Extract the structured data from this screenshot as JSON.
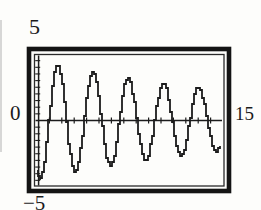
{
  "figure": {
    "kind": "graphing-calculator viewing window (scanned textbook figure)",
    "labels": {
      "ymax": "5",
      "origin": "0",
      "xmax": "15",
      "ymin": "−5"
    },
    "ink_color": "#1c1c1c",
    "frame_color": "#141414",
    "background": "#fdfdfb"
  },
  "chart_data": {
    "type": "line",
    "title": "",
    "xlabel": "",
    "ylabel": "",
    "xlim": [
      0,
      15
    ],
    "ylim": [
      -5,
      5
    ],
    "xscl": 1,
    "yscl": 0.5,
    "grid": false,
    "legend": false,
    "series": [
      {
        "name": "damped-oscillation",
        "model": "y = -A * exp(-k*x) * cos(w*(x - p))",
        "A": 4.45,
        "k": 0.045,
        "w": 2.212,
        "p": 0.25,
        "x_start": 0,
        "x_end": 14.75,
        "sample_step": 0.06,
        "start_point": [
          0,
          -3.8
        ],
        "end_point": [
          14.75,
          -1.8
        ],
        "peaks": [
          [
            1.7,
            4.1
          ],
          [
            4.5,
            3.7
          ],
          [
            7.4,
            3.3
          ],
          [
            10.2,
            2.9
          ],
          [
            13.0,
            2.5
          ]
        ],
        "troughs": [
          [
            0.3,
            -4.4
          ],
          [
            3.1,
            -3.9
          ],
          [
            6.0,
            -3.5
          ],
          [
            8.8,
            -3.1
          ],
          [
            11.6,
            -2.8
          ],
          [
            14.4,
            -2.4
          ]
        ]
      }
    ]
  }
}
